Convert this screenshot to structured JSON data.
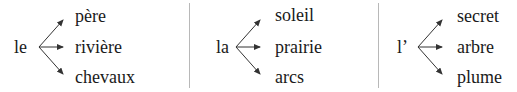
{
  "groups": [
    {
      "article": "le",
      "words": [
        "père",
        "rivière",
        "chevaux"
      ]
    },
    {
      "article": "la",
      "words": [
        "soleil",
        "prairie",
        "arcs"
      ]
    },
    {
      "article": "l’",
      "words": [
        "secret",
        "arbre",
        "plume"
      ]
    }
  ],
  "colors": {
    "text": "#1a1a1a",
    "arrow": "#333333",
    "divider": "#b8b8b8"
  }
}
